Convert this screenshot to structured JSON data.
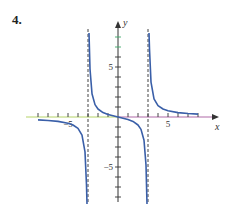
{
  "problem_number": "4.",
  "chart_data": {
    "type": "line",
    "title": "",
    "xlabel": "x",
    "ylabel": "y",
    "xlim": [
      -8,
      9.5
    ],
    "ylim": [
      -8.5,
      9
    ],
    "x_tick_labels": [
      {
        "value": -5,
        "label": "−5"
      },
      {
        "value": 5,
        "label": "5"
      }
    ],
    "y_tick_labels": [
      {
        "value": 5,
        "label": "5"
      },
      {
        "value": -5,
        "label": "−5"
      }
    ],
    "x_ticks": [
      -8,
      -7,
      -6,
      -5,
      -4,
      -3,
      -2,
      -1,
      1,
      2,
      3,
      4,
      5,
      6,
      7,
      8
    ],
    "y_ticks": [
      -8,
      -7,
      -6,
      -5,
      -4,
      -3,
      -2,
      -1,
      1,
      2,
      3,
      4,
      5,
      6,
      7,
      8
    ],
    "vertical_asymptotes": [
      -3,
      3
    ],
    "horizontal_asymptote": 0,
    "function_description": "approximately y = 2x/(x^2 - 9)",
    "series": [
      {
        "name": "branch-left",
        "points": [
          [
            -8,
            -0.29
          ],
          [
            -7,
            -0.35
          ],
          [
            -6,
            -0.44
          ],
          [
            -5,
            -0.63
          ],
          [
            -4.5,
            -0.8
          ],
          [
            -4,
            -1.14
          ],
          [
            -3.6,
            -1.82
          ],
          [
            -3.3,
            -3.49
          ],
          [
            -3.15,
            -6.8
          ],
          [
            -3.1,
            -10
          ]
        ]
      },
      {
        "name": "branch-middle",
        "points": [
          [
            -2.9,
            10
          ],
          [
            -2.8,
            4.8
          ],
          [
            -2.6,
            2.33
          ],
          [
            -2.3,
            1.24
          ],
          [
            -2,
            0.8
          ],
          [
            -1.5,
            0.44
          ],
          [
            -1,
            0.25
          ],
          [
            0,
            0
          ],
          [
            1,
            -0.25
          ],
          [
            1.5,
            -0.44
          ],
          [
            2,
            -0.8
          ],
          [
            2.3,
            -1.24
          ],
          [
            2.6,
            -2.33
          ],
          [
            2.8,
            -4.8
          ],
          [
            2.9,
            -10
          ]
        ]
      },
      {
        "name": "branch-right",
        "points": [
          [
            3.1,
            10
          ],
          [
            3.15,
            6.8
          ],
          [
            3.3,
            3.49
          ],
          [
            3.6,
            1.82
          ],
          [
            4,
            1.14
          ],
          [
            4.5,
            0.8
          ],
          [
            5,
            0.63
          ],
          [
            6,
            0.44
          ],
          [
            7,
            0.35
          ],
          [
            8,
            0.29
          ]
        ]
      }
    ],
    "colors": {
      "curve": "#3a5fa8",
      "asymptote": "#444444",
      "x_axis_left": "#b5d36a",
      "x_axis_right": "#b06aa8",
      "axis": "#333333",
      "y_axis_top_ticks": "#3fa86a"
    },
    "grid": false,
    "legend": "none"
  }
}
